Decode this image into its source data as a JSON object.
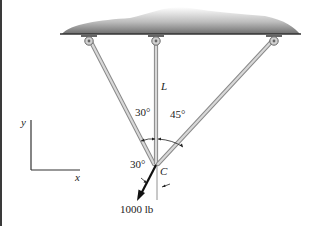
{
  "diagram": {
    "type": "statics-three-cable-support",
    "labels": {
      "member_label": "L",
      "joint_label": "C",
      "angle_left": "30°",
      "angle_right": "45°",
      "angle_force": "30°",
      "force": "1000 lb",
      "axis_x": "x",
      "axis_y": "y"
    },
    "colors": {
      "ceiling_dark": "#555555",
      "ceiling_light": "#e6e6e6",
      "member_fill": "#cfcfcf",
      "member_edge": "#8a8a8a",
      "line": "#222222"
    }
  }
}
